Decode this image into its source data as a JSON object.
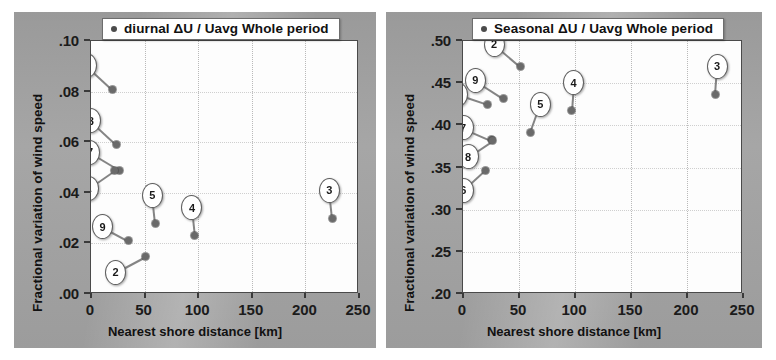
{
  "figure": {
    "background": "#ffffff",
    "panel_background": "#9f9f9f",
    "plot_background": "#fdfdfd",
    "marker_color": "#6a6a6a",
    "axis_color": "#3a3a3a"
  },
  "panels": [
    {
      "id": "left",
      "legend": {
        "label": "diurnal ΔU / Uavg   Whole period",
        "marker": "filled-circle"
      },
      "axis_title_y": "Fractional variation of wind speed",
      "axis_title_x": "Nearest shore distance [km]",
      "yticks": [
        ".00",
        ".02",
        ".04",
        ".06",
        ".08",
        ".10"
      ],
      "xticks": [
        "0",
        "50",
        "100",
        "150",
        "200",
        "250"
      ]
    },
    {
      "id": "right",
      "legend": {
        "label": "Seasonal ΔU / Uavg   Whole period",
        "marker": "filled-circle"
      },
      "axis_title_y": "Fractional variation of wind speed",
      "axis_title_x": "Nearest shore distance [km]",
      "yticks": [
        ".20",
        ".25",
        ".30",
        ".35",
        ".40",
        ".45",
        ".50"
      ],
      "xticks": [
        "0",
        "50",
        "100",
        "150",
        "200",
        "250"
      ]
    }
  ],
  "chart_data": [
    {
      "type": "scatter",
      "title": "diurnal ΔU / Uavg   Whole period",
      "xlabel": "Nearest shore distance [km]",
      "ylabel": "Fractional variation of wind speed",
      "xlim": [
        0,
        250
      ],
      "ylim": [
        0.0,
        0.1
      ],
      "xticks": [
        0,
        50,
        100,
        150,
        200,
        250
      ],
      "yticks": [
        0.0,
        0.02,
        0.04,
        0.06,
        0.08,
        0.1
      ],
      "grid": true,
      "legend_position": "top-center",
      "series": [
        {
          "name": "diurnal ΔU / Uavg   Whole period",
          "points": [
            {
              "label": "6",
              "x": 20,
              "y": 0.081
            },
            {
              "label": "8",
              "x": 24,
              "y": 0.059
            },
            {
              "label": "7",
              "x": 27,
              "y": 0.049
            },
            {
              "label": "1",
              "x": 22,
              "y": 0.049
            },
            {
              "label": "9",
              "x": 35,
              "y": 0.021
            },
            {
              "label": "2",
              "x": 51,
              "y": 0.015
            },
            {
              "label": "5",
              "x": 60,
              "y": 0.028
            },
            {
              "label": "4",
              "x": 97,
              "y": 0.023
            },
            {
              "label": "3",
              "x": 225,
              "y": 0.03
            }
          ]
        }
      ]
    },
    {
      "type": "scatter",
      "title": "Seasonal ΔU / Uavg   Whole period",
      "xlabel": "Nearest shore distance [km]",
      "ylabel": "Fractional variation of wind speed",
      "xlim": [
        0,
        250
      ],
      "ylim": [
        0.2,
        0.5
      ],
      "xticks": [
        0,
        50,
        100,
        150,
        200,
        250
      ],
      "yticks": [
        0.2,
        0.25,
        0.3,
        0.35,
        0.4,
        0.45,
        0.5
      ],
      "grid": true,
      "legend_position": "top-center",
      "series": [
        {
          "name": "Seasonal ΔU / Uavg   Whole period",
          "points": [
            {
              "label": "2",
              "x": 51,
              "y": 0.47
            },
            {
              "label": "9",
              "x": 36,
              "y": 0.432
            },
            {
              "label": "1",
              "x": 22,
              "y": 0.425
            },
            {
              "label": "7",
              "x": 25,
              "y": 0.383
            },
            {
              "label": "8",
              "x": 26,
              "y": 0.382
            },
            {
              "label": "6",
              "x": 20,
              "y": 0.347
            },
            {
              "label": "5",
              "x": 60,
              "y": 0.392
            },
            {
              "label": "4",
              "x": 97,
              "y": 0.417
            },
            {
              "label": "3",
              "x": 225,
              "y": 0.437
            }
          ]
        }
      ]
    }
  ]
}
